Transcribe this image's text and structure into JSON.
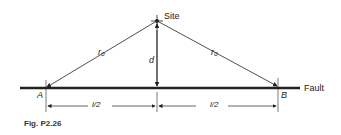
{
  "figure": {
    "caption": "Fig. P2.26",
    "labels": {
      "site": "Site",
      "fault": "Fault",
      "point_a": "A",
      "point_b": "B",
      "r0_left": "r₀",
      "r0_right": "r₀",
      "d": "d",
      "half_left": "l/2",
      "half_right": "l/2"
    },
    "colors": {
      "line": "#222222",
      "background": "#ffffff"
    }
  }
}
